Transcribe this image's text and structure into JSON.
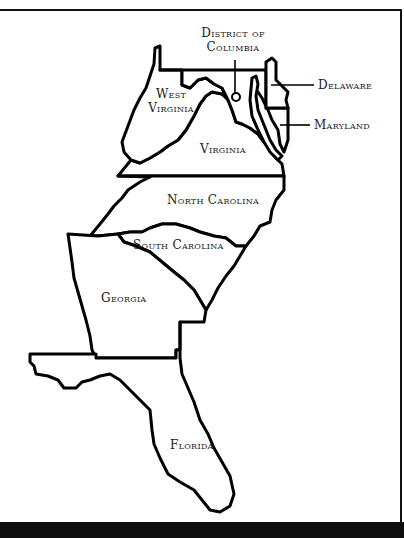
{
  "map": {
    "title": "",
    "colors": {
      "outline": "#000000",
      "fill": "#ffffff",
      "band": "#0d0d0d",
      "text": "#1a1a1a"
    },
    "labels": {
      "dc_line1": "District of",
      "dc_line2": "Columbia",
      "delaware": "Delaware",
      "maryland": "Maryland",
      "west_line1": "West",
      "west_line2": "Virginia",
      "virginia": "Virginia",
      "north_carolina": "North Carolina",
      "south_carolina": "South Carolina",
      "georgia": "Georgia",
      "florida": "Florida"
    }
  }
}
